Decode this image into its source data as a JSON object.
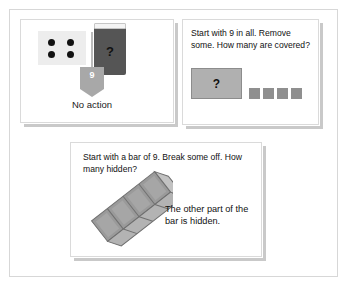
{
  "page": {
    "background_color": "#ffffff",
    "frame_color": "#d7d7d7"
  },
  "panel_one": {
    "name": "No action panel",
    "dice": {
      "label": "four-dot tile",
      "dot_count": 4,
      "tile_color": "#ededed",
      "dot_color": "#111111"
    },
    "card": {
      "mark": "?",
      "card_color": "#555555",
      "top_band_color": "#f4f4f4"
    },
    "tag": {
      "value": "9",
      "tag_color": "#a8a8a8",
      "text_color": "#ffffff"
    },
    "caption": "No action"
  },
  "panel_two": {
    "name": "Remove some panel",
    "prompt": "Start with 9 in all. Remove some. How many are covered?",
    "unknown_box": {
      "mark": "?",
      "fill_color": "#b0b0b0",
      "border_color": "#8c8c8c"
    },
    "unit_squares": {
      "count": 4,
      "color": "#8f8f8f"
    }
  },
  "panel_three": {
    "name": "Bar of 9 panel",
    "prompt": "Start with a bar of 9. Break some off. How many hidden?",
    "note": "The other part of the bar is hidden.",
    "bar": {
      "label": "broken cube bar",
      "segment_count": 4,
      "face_color": "#9a9a9a",
      "top_color": "#b5b5b5",
      "edge_color": "#6f6f6f"
    }
  }
}
